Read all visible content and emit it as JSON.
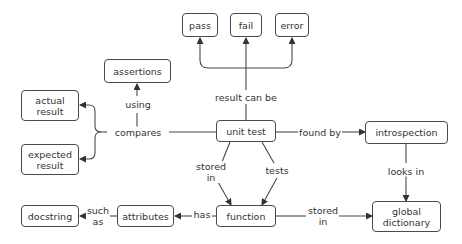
{
  "diagram": {
    "type": "concept-map",
    "colors": {
      "stroke": "#4a4a4a",
      "text": "#333333",
      "background": "#ffffff"
    },
    "nodes": {
      "pass": {
        "label": "pass"
      },
      "fail": {
        "label": "fail"
      },
      "error": {
        "label": "error"
      },
      "assertions": {
        "label": "assertions"
      },
      "actual_result": {
        "label": "actual\nresult"
      },
      "expected_result": {
        "label": "expected\nresult"
      },
      "unit_test": {
        "label": "unit test"
      },
      "introspection": {
        "label": "introspection"
      },
      "function": {
        "label": "function"
      },
      "attributes": {
        "label": "attributes"
      },
      "docstring": {
        "label": "docstring"
      },
      "global_dictionary": {
        "label": "global\ndictionary"
      }
    },
    "edges": {
      "result_can_be": {
        "label": "result can be",
        "from": "unit test",
        "to": [
          "pass",
          "fail",
          "error"
        ]
      },
      "compares": {
        "label": "compares",
        "from": "unit test",
        "to": [
          "actual result",
          "expected result"
        ]
      },
      "using": {
        "label": "using",
        "from": "compares",
        "to": "assertions"
      },
      "found_by": {
        "label": "found by",
        "from": "unit test",
        "to": "introspection"
      },
      "looks_in": {
        "label": "looks in",
        "from": "introspection",
        "to": "global dictionary"
      },
      "stored_in_unit": {
        "label": "stored\nin",
        "from": "unit test",
        "to": "function"
      },
      "tests": {
        "label": "tests",
        "from": "unit test",
        "to": "function"
      },
      "stored_in_function": {
        "label": "stored\nin",
        "from": "function",
        "to": "global dictionary"
      },
      "has": {
        "label": "has",
        "from": "function",
        "to": "attributes"
      },
      "such_as": {
        "label": "such\nas",
        "from": "attributes",
        "to": "docstring"
      }
    }
  }
}
